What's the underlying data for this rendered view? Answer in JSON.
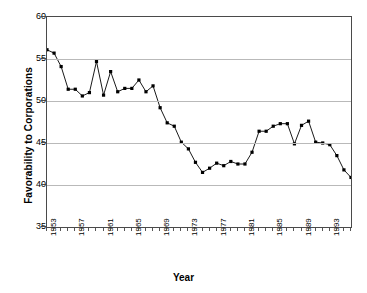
{
  "chart_data": {
    "type": "line",
    "title": "",
    "xlabel": "Year",
    "ylabel": "Favorability to Corporations",
    "ylim": [
      35,
      60
    ],
    "xlim": [
      1953,
      1996
    ],
    "ytick_labels": [
      "60",
      "55",
      "50",
      "45",
      "40",
      "35"
    ],
    "ytick_values": [
      60,
      55,
      50,
      45,
      40,
      35
    ],
    "xtick_labels": [
      "1953",
      "1957",
      "1961",
      "1965",
      "1969",
      "1973",
      "1977",
      "1981",
      "1985",
      "1989",
      "1993"
    ],
    "xtick_values": [
      1953,
      1957,
      1961,
      1965,
      1969,
      1973,
      1977,
      1981,
      1985,
      1989,
      1993
    ],
    "grid": "horizontal",
    "legend": "none",
    "marker": "filled-square",
    "series": [
      {
        "name": "Favorability to Corporations",
        "x": [
          1953,
          1954,
          1955,
          1956,
          1957,
          1958,
          1959,
          1960,
          1961,
          1962,
          1963,
          1964,
          1965,
          1966,
          1967,
          1968,
          1969,
          1970,
          1971,
          1972,
          1973,
          1974,
          1975,
          1976,
          1977,
          1978,
          1979,
          1980,
          1981,
          1982,
          1983,
          1984,
          1985,
          1986,
          1987,
          1988,
          1989,
          1990,
          1991,
          1992,
          1993,
          1994,
          1995,
          1996
        ],
        "values": [
          56.1,
          55.7,
          54.1,
          51.4,
          51.4,
          50.6,
          51.0,
          54.7,
          50.7,
          53.5,
          51.1,
          51.5,
          51.5,
          52.5,
          51.1,
          51.8,
          49.2,
          47.4,
          47.0,
          45.1,
          44.3,
          42.7,
          41.5,
          42.0,
          42.6,
          42.3,
          42.8,
          42.5,
          42.5,
          43.9,
          46.4,
          46.4,
          47.0,
          47.3,
          47.3,
          44.9,
          47.1,
          47.6,
          45.1,
          45.0,
          44.8,
          43.5,
          41.8,
          40.9
        ]
      }
    ]
  }
}
